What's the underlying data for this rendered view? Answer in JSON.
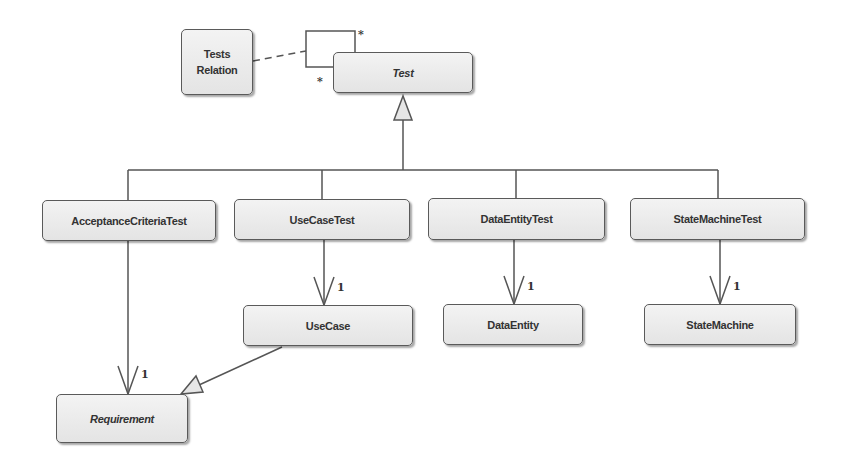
{
  "diagram": {
    "type": "UML class diagram",
    "classes": [
      {
        "id": "tests_relation",
        "label": "Tests Relation",
        "line1": "Tests",
        "line2": "Relation",
        "abstract": false
      },
      {
        "id": "test",
        "label": "Test",
        "abstract": true
      },
      {
        "id": "acceptance_criteria_test",
        "label": "AcceptanceCriteriaTest",
        "abstract": false
      },
      {
        "id": "use_case_test",
        "label": "UseCaseTest",
        "abstract": false
      },
      {
        "id": "data_entity_test",
        "label": "DataEntityTest",
        "abstract": false
      },
      {
        "id": "state_machine_test",
        "label": "StateMachineTest",
        "abstract": false
      },
      {
        "id": "use_case",
        "label": "UseCase",
        "abstract": false
      },
      {
        "id": "data_entity",
        "label": "DataEntity",
        "abstract": false
      },
      {
        "id": "state_machine",
        "label": "StateMachine",
        "abstract": false
      },
      {
        "id": "requirement",
        "label": "Requirement",
        "abstract": true
      }
    ],
    "relations": [
      {
        "type": "association-class-link",
        "from": "tests_relation",
        "to": "test-self-association",
        "style": "dashed"
      },
      {
        "type": "self-association",
        "on": "test",
        "multiplicity_source": "*",
        "multiplicity_target": "*"
      },
      {
        "type": "generalization",
        "from": "acceptance_criteria_test",
        "to": "test"
      },
      {
        "type": "generalization",
        "from": "use_case_test",
        "to": "test"
      },
      {
        "type": "generalization",
        "from": "data_entity_test",
        "to": "test"
      },
      {
        "type": "generalization",
        "from": "state_machine_test",
        "to": "test"
      },
      {
        "type": "association",
        "from": "acceptance_criteria_test",
        "to": "requirement",
        "multiplicity": "1"
      },
      {
        "type": "association",
        "from": "use_case_test",
        "to": "use_case",
        "multiplicity": "1"
      },
      {
        "type": "association",
        "from": "data_entity_test",
        "to": "data_entity",
        "multiplicity": "1"
      },
      {
        "type": "association",
        "from": "state_machine_test",
        "to": "state_machine",
        "multiplicity": "1"
      },
      {
        "type": "generalization",
        "from": "use_case",
        "to": "requirement"
      }
    ],
    "multiplicity_labels": {
      "self_top": "*",
      "self_bottom": "*",
      "acceptance_to_requirement": "1",
      "usecasetest_to_usecase": "1",
      "dataentitytest_to_dataentity": "1",
      "statemachinetest_to_statemachine": "1"
    },
    "colors": {
      "box_fill_top": "#f3f3f3",
      "box_fill_bottom": "#e4e4e4",
      "box_border": "#5a5a5a",
      "line": "#555555",
      "text": "#333333"
    }
  }
}
